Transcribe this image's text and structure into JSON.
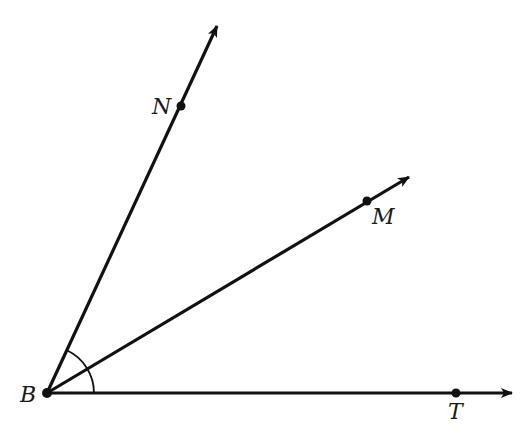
{
  "diagram": {
    "type": "angle-rays",
    "vertex": {
      "label": "B",
      "x": 47,
      "y": 393
    },
    "rays": [
      {
        "name": "BN",
        "point_label": "N",
        "point": {
          "x": 181,
          "y": 106
        },
        "arrow_tip": {
          "x": 219,
          "y": 22
        }
      },
      {
        "name": "BM",
        "point_label": "M",
        "point": {
          "x": 367,
          "y": 201
        },
        "arrow_tip": {
          "x": 412,
          "y": 175
        }
      },
      {
        "name": "BT",
        "point_label": "T",
        "point": {
          "x": 456,
          "y": 393
        },
        "arrow_tip": {
          "x": 515,
          "y": 393
        }
      }
    ],
    "angle_mark": {
      "from_ray": "BN",
      "to_ray": "BT",
      "radius": 47
    },
    "labels": {
      "B": "B",
      "N": "N",
      "M": "M",
      "T": "T"
    },
    "colors": {
      "stroke": "#111111",
      "background": "#ffffff"
    }
  }
}
